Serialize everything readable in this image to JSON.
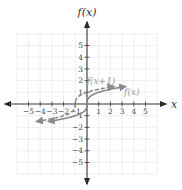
{
  "chart_data": {
    "type": "line",
    "title": "",
    "xlabel": "x",
    "ylabel": "f(x)",
    "xlim": [
      -6,
      6
    ],
    "ylim": [
      -6,
      6
    ],
    "grid": true,
    "x_ticks": [
      -5,
      -4,
      -3,
      -2,
      -1,
      1,
      2,
      3,
      4,
      5
    ],
    "y_ticks": [
      -5,
      -4,
      -3,
      -2,
      -1,
      1,
      2,
      3,
      4,
      5
    ],
    "x_tick_labels": [
      "−5",
      "−4",
      "−3",
      "−2",
      "−1",
      "1",
      "2",
      "3",
      "4",
      "5"
    ],
    "y_tick_labels": [
      "−5",
      "−4",
      "−3",
      "−2",
      "−1",
      "1",
      "2",
      "3",
      "4",
      "5"
    ],
    "series": [
      {
        "name": "f(x)",
        "label": "f(x)",
        "function": "cbrt(x)",
        "style": "solid",
        "color": "#8a8a8a",
        "x_range": [
          -3.3,
          3.3
        ],
        "points": [
          [
            -3,
            -1.44
          ],
          [
            -2,
            -1.26
          ],
          [
            -1,
            -1
          ],
          [
            -0.5,
            -0.79
          ],
          [
            0,
            0
          ],
          [
            0.5,
            0.79
          ],
          [
            1,
            1
          ],
          [
            2,
            1.26
          ],
          [
            3,
            1.44
          ]
        ],
        "label_at": [
          3,
          1
        ]
      },
      {
        "name": "f(x+1)",
        "label": "f(x+1)",
        "function": "cbrt(x+1)",
        "style": "dashed",
        "color": "#8a8a8a",
        "x_range": [
          -4.3,
          2.3
        ],
        "points": [
          [
            -4,
            -1.44
          ],
          [
            -3,
            -1.26
          ],
          [
            -2,
            -1
          ],
          [
            -1.5,
            -0.79
          ],
          [
            -1,
            0
          ],
          [
            -0.5,
            0.79
          ],
          [
            0,
            1
          ],
          [
            1,
            1.26
          ],
          [
            2,
            1.44
          ]
        ],
        "label_at": [
          1,
          2
        ]
      }
    ]
  }
}
